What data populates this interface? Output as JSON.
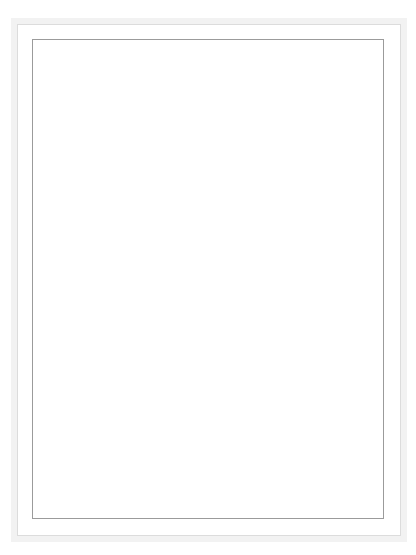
{
  "figure": {
    "zone_labels": [
      {
        "text": "Conducting zone",
        "lines": [
          "Conducting zone"
        ]
      },
      {
        "text": "Transitional and respiratory zones",
        "line1": "Transitional and",
        "line2": "respiratory zones"
      }
    ],
    "z_column": {
      "header": "Z",
      "values": [
        "0",
        "1",
        "2",
        "3",
        "4",
        "5",
        "16",
        "17",
        "18",
        "19",
        "20",
        "21",
        "22",
        "23"
      ],
      "arrow_note": "vertical arrow from 5 to 16 indicating generations 6-15"
    },
    "structure_labels": [
      {
        "name": "trachea",
        "text": "Trachea"
      },
      {
        "name": "bronchi",
        "text": "Bronchi"
      },
      {
        "name": "bronchioles",
        "text": "Bronchioles"
      },
      {
        "name": "terminal-bronchioles",
        "line1": "Terminal",
        "line2": "bronchioles"
      },
      {
        "name": "respiratory-bronchioles",
        "line1": "Respiratory",
        "line2": "bronchioles"
      },
      {
        "name": "alveolar-ducts",
        "line1": "Alveolar",
        "line2": "ducts"
      },
      {
        "name": "alveolar-sacs",
        "line1": "Alveolar",
        "line2": "sacs"
      }
    ],
    "t_labels": [
      {
        "base": "T",
        "sub": "3"
      },
      {
        "base": "T",
        "sub": "2"
      },
      {
        "base": "T",
        "sub": "1"
      },
      {
        "base": "T",
        "sub": ""
      }
    ],
    "colors": {
      "conducting_band": "#a9a9a9",
      "respiratory_band": "#6e6e6e",
      "rule": "#8e8e8e",
      "text": "#3d3d3d",
      "airway_fill": "#ffffff",
      "frame": "#f2f2f2"
    }
  }
}
